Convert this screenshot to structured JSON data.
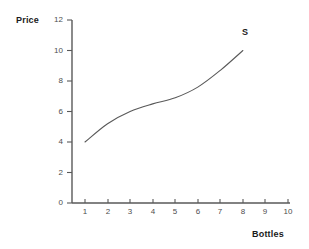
{
  "chart_data": {
    "type": "line",
    "title": "",
    "subtitle": "",
    "xlabel": "Bottles",
    "ylabel": "Price",
    "xlim": [
      0,
      10
    ],
    "ylim": [
      0,
      12
    ],
    "grid": false,
    "legend_position": "inline-right",
    "x_ticks": [
      1,
      2,
      3,
      4,
      5,
      6,
      7,
      8,
      9,
      10
    ],
    "y_ticks": [
      0,
      2,
      4,
      6,
      8,
      10,
      12
    ],
    "series": [
      {
        "name": "S",
        "label": "S",
        "color": "#595959",
        "x": [
          1,
          2,
          3,
          4,
          5,
          6,
          7,
          8
        ],
        "values": [
          4.0,
          5.2,
          6.0,
          6.5,
          6.9,
          7.6,
          8.7,
          10.0
        ]
      }
    ],
    "annotations": [
      {
        "text": "S",
        "x": 8.0,
        "y": 11.2
      }
    ]
  },
  "axes": {
    "y": {
      "title": "Price",
      "tick_labels": [
        "12",
        "10",
        "8",
        "6",
        "4",
        "2",
        "0"
      ]
    },
    "x": {
      "title": "Bottles",
      "tick_labels": [
        "1",
        "2",
        "3",
        "4",
        "5",
        "6",
        "7",
        "8",
        "9",
        "10"
      ]
    }
  },
  "colors": {
    "axis": "#595959",
    "curve": "#595959",
    "tick_text": "#4d4d4d",
    "title_text": "#1a1a1a",
    "background": "#ffffff"
  }
}
